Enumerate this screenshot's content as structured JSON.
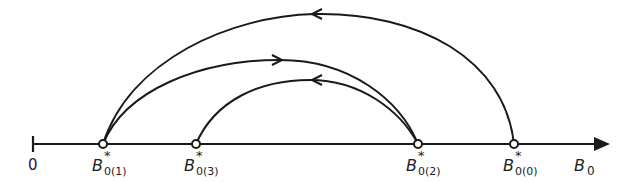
{
  "diagram": {
    "axis": {
      "origin_label": "0",
      "axis_label_main": "B",
      "axis_label_sub": "0"
    },
    "points": [
      {
        "id": "p1",
        "main": "B",
        "sup": "*",
        "sub": "0(1)"
      },
      {
        "id": "p3",
        "main": "B",
        "sup": "*",
        "sub": "0(3)"
      },
      {
        "id": "p2",
        "main": "B",
        "sup": "*",
        "sub": "0(2)"
      },
      {
        "id": "p0",
        "main": "B",
        "sup": "*",
        "sub": "0(0)"
      }
    ],
    "arcs": [
      {
        "from": "B*0(0)",
        "to": "B*0(1)",
        "direction": "leftward"
      },
      {
        "from": "B*0(1)",
        "to": "B*0(2)",
        "direction": "rightward"
      },
      {
        "from": "B*0(2)",
        "to": "B*0(3)",
        "direction": "leftward"
      }
    ],
    "colors": {
      "stroke": "#1a1a1a",
      "background": "#ffffff"
    }
  }
}
